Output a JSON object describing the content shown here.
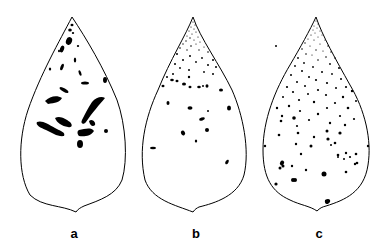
{
  "figure": {
    "panels": [
      {
        "id": "a",
        "label": "a",
        "description": "Leaf with large elongated black lesions concentrated in upper-middle region"
      },
      {
        "id": "b",
        "label": "b",
        "description": "Leaf with fine stippling near tip and scattered small spots"
      },
      {
        "id": "c",
        "label": "c",
        "description": "Leaf with dense fine stippling near tip and many small spots throughout"
      }
    ],
    "colors": {
      "outline": "#000000",
      "lesion": "#000000",
      "background": "#ffffff"
    }
  }
}
